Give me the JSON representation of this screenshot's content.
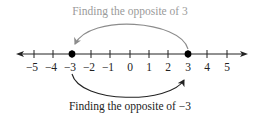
{
  "diagram": {
    "top_caption": "Finding the opposite of 3",
    "bottom_caption": "Finding the opposite of −3",
    "tick_labels": [
      "−5",
      "−4",
      "−3",
      "−2",
      "−1",
      "0",
      "1",
      "2",
      "3",
      "4",
      "5"
    ],
    "tick_values": [
      -5,
      -4,
      -3,
      -2,
      -1,
      0,
      1,
      2,
      3,
      4,
      5
    ],
    "points": [
      -3,
      3
    ],
    "top_arrow": {
      "from": 3,
      "to": -3
    },
    "bottom_arrow": {
      "from": -3,
      "to": 3
    },
    "colors": {
      "axis": "#222222",
      "top_arrow": "#8c8c8c",
      "top_caption": "#9a9a9a",
      "bottom_arrow": "#222222",
      "bottom_caption": "#222222",
      "point": "#000000"
    }
  }
}
